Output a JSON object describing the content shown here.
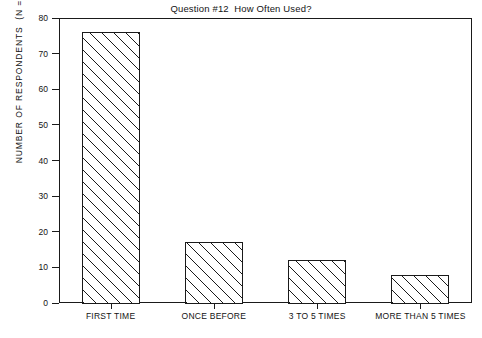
{
  "chart_data": {
    "type": "bar",
    "title": "Question #12  How Often Used?",
    "xlabel": "",
    "ylabel": "NUMBER OF RESPONDENTS  (N = 112)",
    "categories": [
      "FIRST TIME",
      "ONCE BEFORE",
      "3 TO 5 TIMES",
      "MORE THAN 5 TIMES"
    ],
    "values": [
      76,
      17,
      12,
      8
    ],
    "ylim": [
      0,
      80
    ],
    "yticks": [
      0,
      10,
      20,
      30,
      40,
      50,
      60,
      70,
      80
    ],
    "ytick_labels": [
      "0",
      "10",
      "20",
      "30",
      "40",
      "50",
      "60",
      "70",
      "80"
    ],
    "grid": false,
    "legend": false,
    "legend_position": "none",
    "bar_fill": "diagonal-hatch",
    "bar_edge_color": "#1a1a1a",
    "bar_face_color": "#ffffff",
    "background_color": "#ffffff",
    "frame": true,
    "sample_size": 112
  }
}
